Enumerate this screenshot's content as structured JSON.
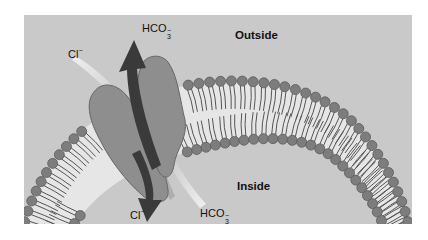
{
  "diagram": {
    "regions": {
      "outside": "Outside",
      "inside": "Inside"
    },
    "ions": {
      "top_chloride": {
        "base": "Cl",
        "charge": "−"
      },
      "top_bicarbonate": {
        "base": "HCO",
        "subscript": "3",
        "charge": "−"
      },
      "bottom_chloride": {
        "base": "Cl",
        "charge": "−"
      },
      "bottom_bicarbonate": {
        "base": "HCO",
        "subscript": "3",
        "charge": "−"
      }
    },
    "flows": [
      {
        "ion": "HCO3-",
        "direction": "inside-to-outside",
        "style": "dark arrow"
      },
      {
        "ion": "Cl-",
        "direction": "outside-to-inside",
        "style": "dark arrow"
      }
    ],
    "colors": {
      "background_panel": "#c9c9c9",
      "membrane_core": "#e6e6e6",
      "lipid_head": "#7d7d7d",
      "lipid_head_stroke": "#5a5a5a",
      "lipid_tail": "#555555",
      "protein_fill": "#8e8e8e",
      "protein_stroke": "#666666",
      "arrow": "#3a3a3a",
      "gradient_trail": "#f0f0f0"
    }
  }
}
